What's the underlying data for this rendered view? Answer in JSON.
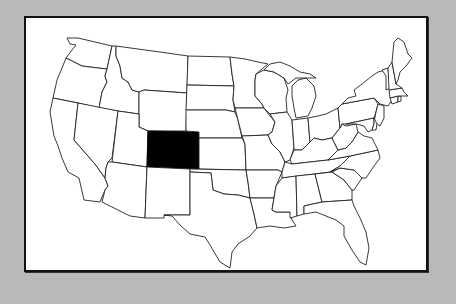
{
  "map": {
    "title": "United States",
    "highlighted_state": "Colorado",
    "colors": {
      "background": "#b9b9b9",
      "panel": "#ffffff",
      "border": "#111111",
      "state_fill": "#ffffff",
      "state_stroke": "#222222",
      "highlight_fill": "#000000"
    },
    "states": [
      {
        "name": "Washington",
        "highlighted": false
      },
      {
        "name": "Oregon",
        "highlighted": false
      },
      {
        "name": "California",
        "highlighted": false
      },
      {
        "name": "Idaho",
        "highlighted": false
      },
      {
        "name": "Nevada",
        "highlighted": false
      },
      {
        "name": "Montana",
        "highlighted": false
      },
      {
        "name": "Wyoming",
        "highlighted": false
      },
      {
        "name": "Utah",
        "highlighted": false
      },
      {
        "name": "Arizona",
        "highlighted": false
      },
      {
        "name": "Colorado",
        "highlighted": true
      },
      {
        "name": "New Mexico",
        "highlighted": false
      },
      {
        "name": "North Dakota",
        "highlighted": false
      },
      {
        "name": "South Dakota",
        "highlighted": false
      },
      {
        "name": "Nebraska",
        "highlighted": false
      },
      {
        "name": "Kansas",
        "highlighted": false
      },
      {
        "name": "Oklahoma",
        "highlighted": false
      },
      {
        "name": "Texas",
        "highlighted": false
      },
      {
        "name": "Minnesota",
        "highlighted": false
      },
      {
        "name": "Iowa",
        "highlighted": false
      },
      {
        "name": "Missouri",
        "highlighted": false
      },
      {
        "name": "Arkansas",
        "highlighted": false
      },
      {
        "name": "Louisiana",
        "highlighted": false
      },
      {
        "name": "Wisconsin",
        "highlighted": false
      },
      {
        "name": "Illinois",
        "highlighted": false
      },
      {
        "name": "Michigan",
        "highlighted": false
      },
      {
        "name": "Indiana",
        "highlighted": false
      },
      {
        "name": "Ohio",
        "highlighted": false
      },
      {
        "name": "Kentucky",
        "highlighted": false
      },
      {
        "name": "Tennessee",
        "highlighted": false
      },
      {
        "name": "Mississippi",
        "highlighted": false
      },
      {
        "name": "Alabama",
        "highlighted": false
      },
      {
        "name": "Georgia",
        "highlighted": false
      },
      {
        "name": "Florida",
        "highlighted": false
      },
      {
        "name": "South Carolina",
        "highlighted": false
      },
      {
        "name": "North Carolina",
        "highlighted": false
      },
      {
        "name": "Virginia",
        "highlighted": false
      },
      {
        "name": "West Virginia",
        "highlighted": false
      },
      {
        "name": "Pennsylvania",
        "highlighted": false
      },
      {
        "name": "New York",
        "highlighted": false
      },
      {
        "name": "Maryland",
        "highlighted": false
      },
      {
        "name": "Delaware",
        "highlighted": false
      },
      {
        "name": "New Jersey",
        "highlighted": false
      },
      {
        "name": "Connecticut",
        "highlighted": false
      },
      {
        "name": "Rhode Island",
        "highlighted": false
      },
      {
        "name": "Massachusetts",
        "highlighted": false
      },
      {
        "name": "Vermont",
        "highlighted": false
      },
      {
        "name": "New Hampshire",
        "highlighted": false
      },
      {
        "name": "Maine",
        "highlighted": false
      }
    ]
  }
}
